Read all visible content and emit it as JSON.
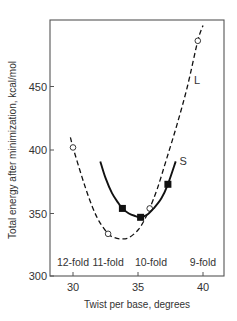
{
  "chart_data": {
    "type": "line",
    "title": "",
    "xlabel": "Twist per base, degrees",
    "ylabel": "Total energy after minimization, kcal/mol",
    "xlim": [
      28.2,
      41.6
    ],
    "ylim": [
      300,
      502
    ],
    "xticks": [
      30,
      35,
      40
    ],
    "xtick_labels": [
      "30",
      "35",
      "40"
    ],
    "yticks": [
      300,
      350,
      400,
      450
    ],
    "ytick_labels": [
      "300",
      "350",
      "400",
      "450"
    ],
    "grid": false,
    "series": [
      {
        "name": "L",
        "style": "dashed",
        "marker": "open-circle",
        "points": [
          {
            "x": 30.0,
            "y": 402
          },
          {
            "x": 32.7,
            "y": 334
          },
          {
            "x": 35.9,
            "y": 354
          },
          {
            "x": 39.6,
            "y": 486
          }
        ],
        "curve": [
          [
            29.8,
            410
          ],
          [
            30.0,
            402
          ],
          [
            30.5,
            385
          ],
          [
            31.0,
            369
          ],
          [
            31.5,
            355
          ],
          [
            32.0,
            344
          ],
          [
            32.7,
            334
          ],
          [
            33.2,
            331
          ],
          [
            33.7,
            330
          ],
          [
            34.3,
            331
          ],
          [
            35.0,
            337
          ],
          [
            35.5,
            345
          ],
          [
            35.9,
            354
          ],
          [
            36.5,
            370
          ],
          [
            37.2,
            393
          ],
          [
            38.0,
            420
          ],
          [
            38.8,
            450
          ],
          [
            39.6,
            486
          ],
          [
            40.0,
            498
          ]
        ]
      },
      {
        "name": "S",
        "style": "solid",
        "marker": "filled-square",
        "points": [
          {
            "x": 33.8,
            "y": 354
          },
          {
            "x": 35.2,
            "y": 347
          },
          {
            "x": 37.3,
            "y": 373
          }
        ],
        "curve": [
          [
            32.1,
            391
          ],
          [
            32.5,
            378
          ],
          [
            33.0,
            366
          ],
          [
            33.5,
            358
          ],
          [
            33.8,
            354
          ],
          [
            34.3,
            350
          ],
          [
            34.8,
            348
          ],
          [
            35.2,
            347
          ],
          [
            35.7,
            349
          ],
          [
            36.2,
            354
          ],
          [
            36.8,
            362
          ],
          [
            37.3,
            373
          ],
          [
            37.9,
            391
          ]
        ]
      }
    ],
    "annotations": [
      {
        "text": "12-fold",
        "x": 30.0,
        "y": 312
      },
      {
        "text": "11-fold",
        "x": 32.7,
        "y": 312
      },
      {
        "text": "10-fold",
        "x": 36.0,
        "y": 312
      },
      {
        "text": "9-fold",
        "x": 40.0,
        "y": 312
      }
    ],
    "series_labels": [
      {
        "text": "L",
        "x": 39.3,
        "y": 452
      },
      {
        "text": "S",
        "x": 38.2,
        "y": 388
      }
    ]
  }
}
